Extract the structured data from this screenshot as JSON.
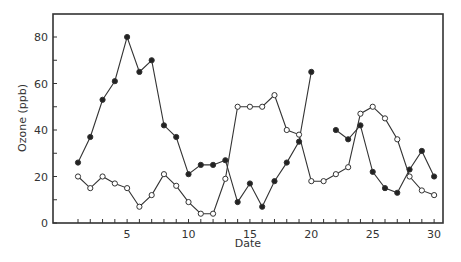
{
  "chart_data": {
    "type": "line",
    "title": "",
    "xlabel": "Date",
    "ylabel": "Ozone (ppb)",
    "xlim": [
      -1,
      31
    ],
    "ylim": [
      0,
      90
    ],
    "x_ticks": [
      5,
      10,
      15,
      20,
      25,
      30
    ],
    "x_minor_ticks": [
      1,
      2,
      3,
      4,
      5,
      6,
      7,
      8,
      9,
      10,
      11,
      12,
      13,
      14,
      15,
      16,
      17,
      18,
      19,
      20,
      21,
      22,
      23,
      24,
      25,
      26,
      27,
      28,
      29,
      30
    ],
    "y_ticks": [
      0,
      20,
      40,
      60,
      80
    ],
    "y_minor_ticks": [
      10,
      30,
      50,
      70
    ],
    "grid": false,
    "legend": null,
    "series": [
      {
        "name": "filled",
        "marker": "filled-circle",
        "segments": [
          {
            "x": [
              1,
              2,
              3,
              4,
              5,
              6,
              7,
              8,
              9,
              10,
              11,
              12,
              13,
              14,
              15,
              16,
              17,
              18,
              19,
              20
            ],
            "y": [
              26,
              37,
              53,
              61,
              80,
              65,
              70,
              42,
              37,
              21,
              25,
              25,
              27,
              9,
              17,
              7,
              18,
              26,
              35,
              65
            ]
          },
          {
            "x": [
              22,
              23,
              24,
              25,
              26,
              27,
              28,
              29,
              30
            ],
            "y": [
              40,
              36,
              42,
              22,
              15,
              13,
              23,
              31,
              20
            ]
          }
        ]
      },
      {
        "name": "open",
        "marker": "open-circle",
        "segments": [
          {
            "x": [
              1,
              2,
              3,
              4,
              5,
              6,
              7,
              8,
              9,
              10,
              11,
              12,
              13,
              14,
              15,
              16,
              17,
              18,
              19,
              20,
              21,
              22,
              23,
              24,
              25,
              26,
              27,
              28,
              29,
              30
            ],
            "y": [
              20,
              15,
              20,
              17,
              15,
              7,
              12,
              21,
              16,
              9,
              4,
              4,
              19,
              50,
              50,
              50,
              55,
              40,
              38,
              18,
              18,
              21,
              24,
              47,
              50,
              45,
              36,
              20,
              14,
              12
            ]
          }
        ]
      }
    ]
  }
}
